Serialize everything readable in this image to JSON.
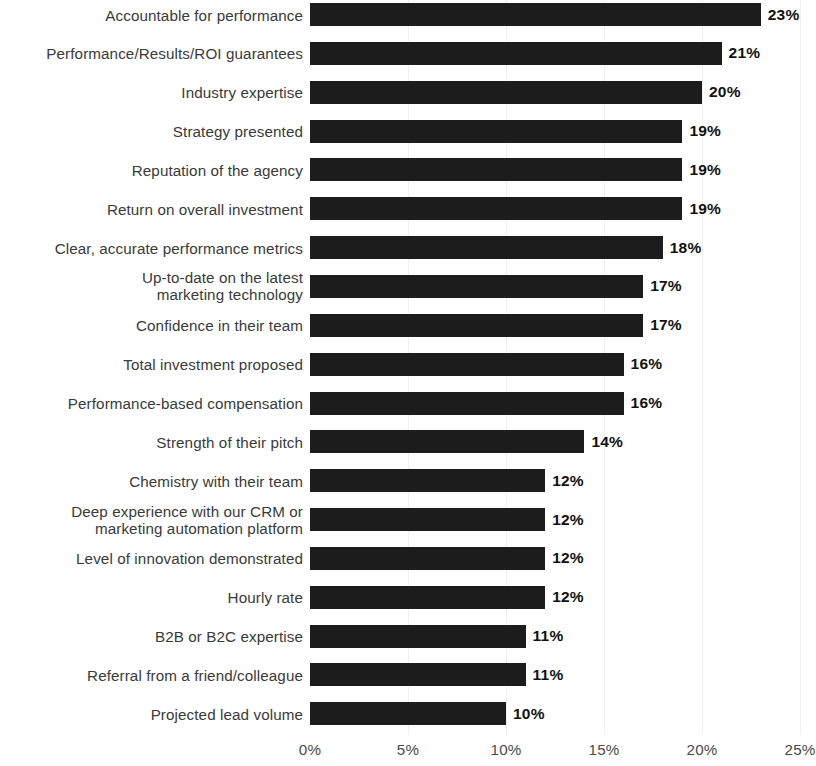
{
  "chart_data": {
    "type": "bar",
    "orientation": "horizontal",
    "title": "",
    "subtitle": "",
    "xlabel": "",
    "ylabel": "",
    "xlim": [
      0,
      25
    ],
    "grid": true,
    "legend": null,
    "value_suffix": "%",
    "xticks": [
      "0%",
      "5%",
      "10%",
      "15%",
      "20%",
      "25%"
    ],
    "xtick_values": [
      0,
      5,
      10,
      15,
      20,
      25
    ],
    "categories": [
      "Accountable for performance",
      "Performance/Results/ROI guarantees",
      "Industry expertise",
      "Strategy presented",
      "Reputation of the agency",
      "Return on overall investment",
      "Clear, accurate performance metrics",
      "Up-to-date on the latest\nmarketing technology",
      "Confidence in their team",
      "Total investment proposed",
      "Performance-based compensation",
      "Strength of their pitch",
      "Chemistry with their team",
      "Deep experience with our CRM or\nmarketing automation platform",
      "Level of innovation demonstrated",
      "Hourly rate",
      "B2B or B2C expertise",
      "Referral from a friend/colleague",
      "Projected lead volume"
    ],
    "values": [
      23,
      21,
      20,
      19,
      19,
      19,
      18,
      17,
      17,
      16,
      16,
      14,
      12,
      12,
      12,
      12,
      11,
      11,
      10
    ],
    "value_labels": [
      "23%",
      "21%",
      "20%",
      "19%",
      "19%",
      "19%",
      "18%",
      "17%",
      "17%",
      "16%",
      "16%",
      "14%",
      "12%",
      "12%",
      "12%",
      "12%",
      "11%",
      "11%",
      "10%"
    ],
    "colors": {
      "bar": "#1c1c1c",
      "value_label": "#111111",
      "category_label": "#3a3a3a",
      "tick_label": "#4a4a4a",
      "gridline": "#f0f0f0",
      "background": "#ffffff"
    }
  }
}
